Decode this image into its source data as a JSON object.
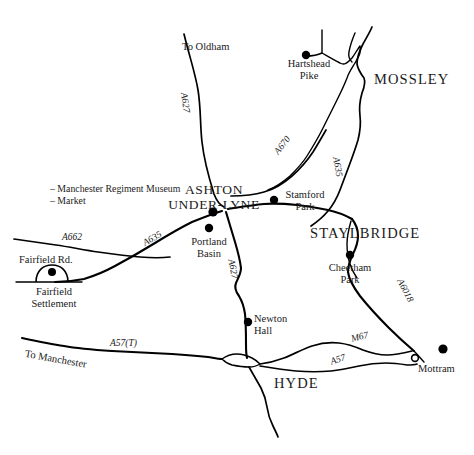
{
  "map": {
    "title": "Ashton-under-Lyne and district road map",
    "background_color": "#ffffff",
    "ink_color": "#000000",
    "width": 474,
    "height": 455,
    "towns": [
      {
        "id": "ashton",
        "label_line1": "ASHTON",
        "label_line2": "UNDER-LYNE"
      },
      {
        "id": "mossley",
        "label": "MOSSLEY"
      },
      {
        "id": "staylbridge",
        "label": "STAYLBRIDGE"
      },
      {
        "id": "hyde",
        "label": "HYDE"
      }
    ],
    "places": [
      {
        "id": "hartshead-pike",
        "label_line1": "Hartshead",
        "label_line2": "Pike"
      },
      {
        "id": "stamford-park",
        "label_line1": "Stamford",
        "label_line2": "Park"
      },
      {
        "id": "portland-basin",
        "label_line1": "Portland",
        "label_line2": "Basin"
      },
      {
        "id": "cheetham-park",
        "label_line1": "Cheetham",
        "label_line2": "Park"
      },
      {
        "id": "newton-hall",
        "label_line1": "Newton",
        "label_line2": "Hall"
      },
      {
        "id": "fairfield-settlement",
        "label_line1": "Fairfield",
        "label_line2": "Settlement"
      },
      {
        "id": "mottram",
        "label": "Mottram"
      }
    ],
    "street_labels": [
      {
        "id": "fairfield-rd",
        "label": "Fairfield Rd."
      }
    ],
    "road_labels": [
      {
        "id": "a627-north",
        "label": "A627"
      },
      {
        "id": "a670",
        "label": "A670"
      },
      {
        "id": "a635-mossley",
        "label": "A635"
      },
      {
        "id": "a635-west",
        "label": "A635"
      },
      {
        "id": "a662",
        "label": "A662"
      },
      {
        "id": "a627-south",
        "label": "A627"
      },
      {
        "id": "a6018",
        "label": "A6018"
      },
      {
        "id": "m67",
        "label": "M67"
      },
      {
        "id": "a57",
        "label": "A57"
      },
      {
        "id": "a57t",
        "label": "A57(T)"
      }
    ],
    "destinations": [
      {
        "id": "to-oldham",
        "label": "To Oldham"
      },
      {
        "id": "to-manchester",
        "label": "To Manchester"
      }
    ],
    "annotations": [
      {
        "id": "manchester-regiment-museum",
        "label": "– Manchester Regiment Museum"
      },
      {
        "id": "market",
        "label": "– Market"
      }
    ]
  }
}
